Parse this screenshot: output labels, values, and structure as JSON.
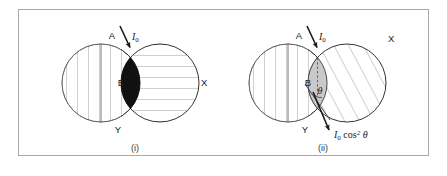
{
  "figure": {
    "background_color": "#ffffff",
    "frame_color": "#a9a9a9",
    "line_color": "#333333",
    "hatch_color": "#777777",
    "lens_fill_dark": "#111111",
    "lens_fill_light": "#c9c9c9",
    "width": 447,
    "height": 176
  },
  "panels": [
    {
      "id": "panel-i",
      "caption": "(i)",
      "left_circle": {
        "label_top": "A",
        "label_bottom": "Y",
        "hatch": "vertical"
      },
      "right_circle": {
        "label_right": "X",
        "hatch": "horizontal"
      },
      "lens": {
        "label": "B",
        "fill": "dark"
      },
      "incident_beam": {
        "label": "I",
        "sub": "0"
      }
    },
    {
      "id": "panel-ii",
      "caption": "(ii)",
      "left_circle": {
        "label_top": "A",
        "label_bottom": "Y",
        "hatch": "vertical"
      },
      "right_circle": {
        "label_right": "X",
        "hatch": "diagonal"
      },
      "lens": {
        "label": "B",
        "fill": "light",
        "angle_label": "θ"
      },
      "incident_beam": {
        "label": "I",
        "sub": "0"
      },
      "output_beam": {
        "label": "I",
        "sub": "0",
        "expression": "cos",
        "exponent": "2",
        "angle": "θ"
      }
    }
  ]
}
